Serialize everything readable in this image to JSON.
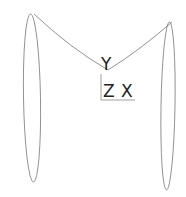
{
  "viewport": {
    "background": "#ffffff",
    "stroke": "#777777"
  },
  "axis_triad": {
    "y_label": "Y",
    "z_label": "Z",
    "x_label": "X"
  }
}
